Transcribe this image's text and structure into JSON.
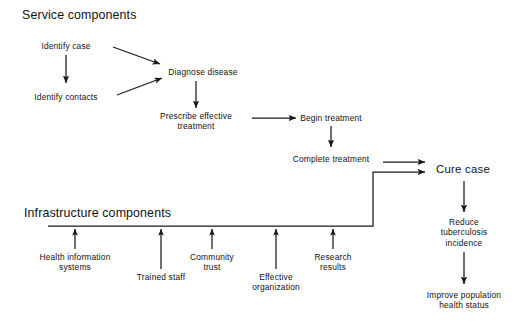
{
  "figure": {
    "type": "flowchart",
    "background": "#ffffff",
    "line_color": "#1a1a1a"
  },
  "headings": [
    {
      "id": "service",
      "label": "Service components",
      "x": 22,
      "y": 8
    },
    {
      "id": "infrastructure",
      "label": "Infrastructure components",
      "x": 24,
      "y": 206
    }
  ],
  "nodes": [
    {
      "id": "identify_case",
      "label": "Identify case",
      "cx": 66,
      "cy": 46,
      "w": 84,
      "size": "normal"
    },
    {
      "id": "identify_contacts",
      "label": "Identify contacts",
      "cx": 66,
      "cy": 97,
      "w": 96,
      "size": "normal"
    },
    {
      "id": "diagnose_disease",
      "label": "Diagnose disease",
      "cx": 203,
      "cy": 72,
      "w": 104,
      "size": "normal"
    },
    {
      "id": "prescribe_treatment",
      "label": "Prescribe effective\ntreatment",
      "cx": 196,
      "cy": 121,
      "w": 104,
      "size": "normal"
    },
    {
      "id": "begin_treatment",
      "label": "Begin treatment",
      "cx": 331,
      "cy": 118,
      "w": 96,
      "size": "normal"
    },
    {
      "id": "complete_treatment",
      "label": "Complete treatment",
      "cx": 331,
      "cy": 159,
      "w": 110,
      "size": "normal"
    },
    {
      "id": "cure_case",
      "label": "Cure case",
      "cx": 463,
      "cy": 170,
      "w": 80,
      "size": "big"
    },
    {
      "id": "reduce_tb",
      "label": "Reduce\ntuberculosis\nincidence",
      "cx": 464,
      "cy": 232,
      "w": 82,
      "size": "normal"
    },
    {
      "id": "improve_health",
      "label": "Improve population\nhealth status",
      "cx": 464,
      "cy": 300,
      "w": 106,
      "size": "normal"
    },
    {
      "id": "health_information",
      "label": "Health information\nsystems",
      "cx": 75,
      "cy": 262,
      "w": 104,
      "size": "normal"
    },
    {
      "id": "trained_staff",
      "label": "Trained staff",
      "cx": 161,
      "cy": 281,
      "w": 80,
      "size": "normal"
    },
    {
      "id": "community_trust",
      "label": "Community\ntrust",
      "cx": 212,
      "cy": 262,
      "w": 72,
      "size": "normal"
    },
    {
      "id": "effective_organization",
      "label": "Effective\norganization",
      "cx": 276,
      "cy": 281,
      "w": 82,
      "size": "normal"
    },
    {
      "id": "research_results",
      "label": "Research\nresults",
      "cx": 333,
      "cy": 262,
      "w": 70,
      "size": "normal"
    }
  ],
  "connectors": [
    {
      "id": "identify-case-to-identify-contacts",
      "kind": "arrow-down"
    },
    {
      "id": "identify-case-to-diagnose",
      "kind": "arrow-diagonal"
    },
    {
      "id": "identify-contacts-to-diagnose",
      "kind": "arrow-diagonal"
    },
    {
      "id": "diagnose-to-prescribe",
      "kind": "arrow-down"
    },
    {
      "id": "prescribe-to-begin",
      "kind": "arrow-right"
    },
    {
      "id": "begin-to-complete",
      "kind": "arrow-down"
    },
    {
      "id": "complete-to-cure",
      "kind": "arrow-right"
    },
    {
      "id": "infrastructure-baseline-to-cure",
      "kind": "elbow-arrow"
    },
    {
      "id": "cure-to-reduce-tb",
      "kind": "arrow-down"
    },
    {
      "id": "reduce-tb-to-improve-health",
      "kind": "arrow-down"
    },
    {
      "id": "health-information-to-baseline",
      "kind": "arrow-up"
    },
    {
      "id": "trained-staff-to-baseline",
      "kind": "arrow-up"
    },
    {
      "id": "community-trust-to-baseline",
      "kind": "arrow-up"
    },
    {
      "id": "effective-organization-to-baseline",
      "kind": "arrow-up"
    },
    {
      "id": "research-results-to-baseline",
      "kind": "arrow-up"
    }
  ]
}
